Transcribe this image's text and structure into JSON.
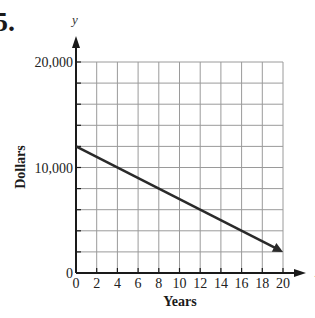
{
  "problem_number": "5.",
  "chart_data": {
    "type": "line",
    "title": "",
    "xlabel": "Years",
    "ylabel": "Dollars",
    "x_axis_var": "x",
    "y_axis_var": "y",
    "xlim": [
      0,
      20
    ],
    "ylim": [
      0,
      20000
    ],
    "x_ticks": [
      0,
      2,
      4,
      6,
      8,
      10,
      12,
      14,
      16,
      18,
      20
    ],
    "x_tick_labels": [
      "0",
      "2",
      "4",
      "6",
      "8",
      "10",
      "12",
      "14",
      "16",
      "18",
      "20"
    ],
    "y_ticks": [
      0,
      2000,
      4000,
      6000,
      8000,
      10000,
      12000,
      14000,
      16000,
      18000,
      20000
    ],
    "y_tick_labels": [
      {
        "value": 0,
        "label": "0"
      },
      {
        "value": 10000,
        "label": "10,000"
      },
      {
        "value": 20000,
        "label": "20,000"
      }
    ],
    "grid": true,
    "legend": null,
    "series": [
      {
        "name": "value",
        "x": [
          0,
          20
        ],
        "y": [
          12000,
          2000
        ],
        "arrow_end": true,
        "color": "#2a2a2a"
      }
    ],
    "colors": {
      "axis": "#1a1a1a",
      "grid": "#9a9a9a",
      "line": "#2a2a2a"
    }
  }
}
